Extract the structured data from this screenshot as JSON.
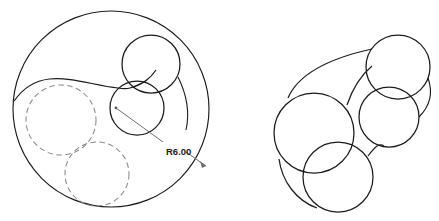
{
  "drawing": {
    "title": "Geometric construction of tangent circles",
    "stroke_color": "#1c1c1c",
    "dashed_color": "#8a8a8a",
    "background_color": "#ffffff",
    "line_width": 1.1,
    "dimension": {
      "label": "R6.00",
      "value": 6.0,
      "prefix": "R",
      "leader_origin": {
        "x": 116,
        "y": 108
      },
      "leader_end": {
        "x": 207,
        "y": 167
      },
      "text_position": {
        "x": 168,
        "y": 151
      }
    },
    "figures": [
      {
        "name": "left-figure",
        "label": "left-figure",
        "outer_circle": {
          "cx": 111,
          "cy": 109,
          "r": 98,
          "style": "solid"
        },
        "solid_circles": [
          {
            "cx": 151,
            "cy": 64,
            "r": 29,
            "style": "solid"
          },
          {
            "cx": 137,
            "cy": 108,
            "r": 27,
            "style": "solid"
          }
        ],
        "dashed_circles": [
          {
            "cx": 61,
            "cy": 120,
            "r": 35,
            "style": "dashed"
          },
          {
            "cx": 97,
            "cy": 174,
            "r": 32,
            "style": "dashed"
          }
        ],
        "fillet_arcs": [
          {
            "from": {
              "x": 14,
              "y": 100
            },
            "to": {
              "x": 128,
              "y": 88
            },
            "radius": 96,
            "sweep": 1
          },
          {
            "from": {
              "x": 128,
              "y": 88
            },
            "to": {
              "x": 180,
              "y": 72
            },
            "radius": 30,
            "sweep": 0
          }
        ]
      },
      {
        "name": "right-figure",
        "label": "right-figure",
        "solid_circles": [
          {
            "cx": 314,
            "cy": 133,
            "r": 40,
            "style": "solid"
          },
          {
            "cx": 398,
            "cy": 67,
            "r": 32,
            "style": "solid"
          },
          {
            "cx": 389,
            "cy": 117,
            "r": 30,
            "style": "solid"
          },
          {
            "cx": 338,
            "cy": 177,
            "r": 35,
            "style": "solid"
          }
        ],
        "fillet_arcs": [
          {
            "from": {
              "x": 289,
              "y": 97
            },
            "to": {
              "x": 374,
              "y": 48
            },
            "radius": 96,
            "sweep": 1
          },
          {
            "from": {
              "x": 424,
              "y": 88
            },
            "to": {
              "x": 417,
              "y": 120
            },
            "radius": 34,
            "sweep": 0
          },
          {
            "from": {
              "x": 281,
              "y": 163
            },
            "to": {
              "x": 317,
              "y": 207
            },
            "radius": 70,
            "sweep": 0
          }
        ]
      }
    ]
  }
}
